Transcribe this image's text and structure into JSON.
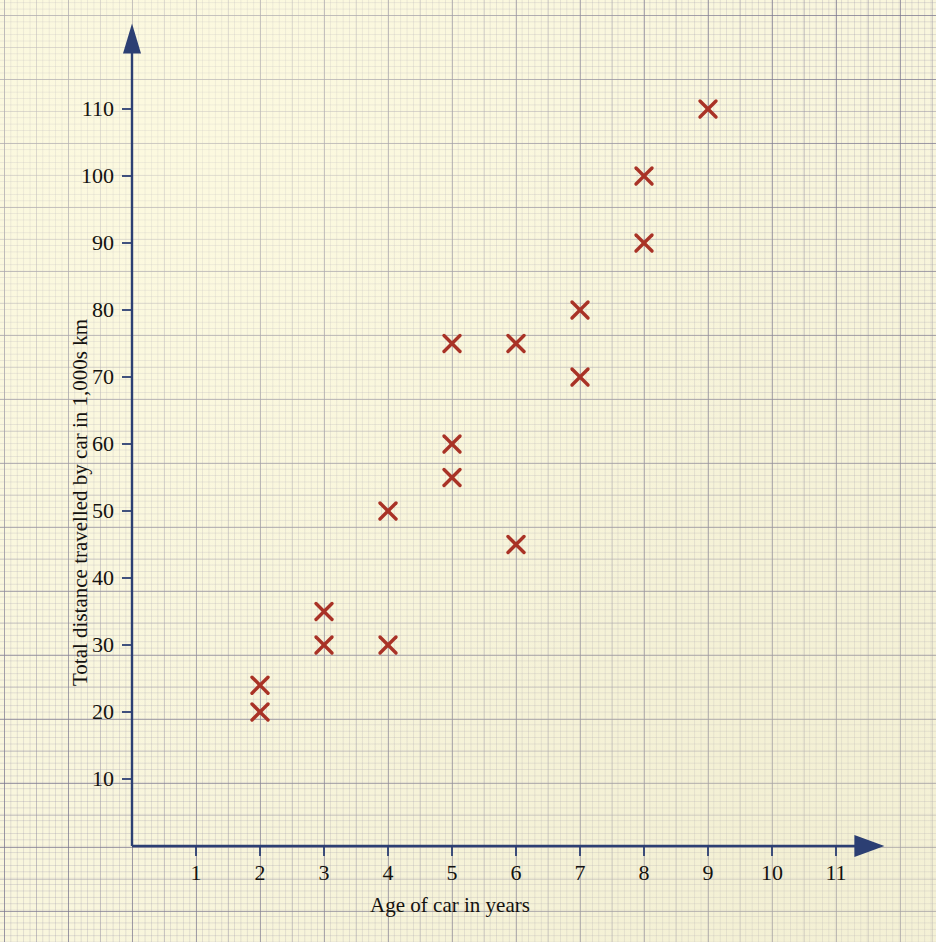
{
  "chart_data": {
    "type": "scatter",
    "title": "",
    "xlabel": "Age of car in years",
    "ylabel": "Total distance travelled by car in 1,000s km",
    "xlim": [
      0,
      11.6
    ],
    "ylim": [
      0,
      118
    ],
    "xticks": [
      1,
      2,
      3,
      4,
      5,
      6,
      7,
      8,
      9,
      10,
      11
    ],
    "yticks": [
      10,
      20,
      30,
      40,
      50,
      60,
      70,
      80,
      90,
      100,
      110
    ],
    "xtick_labels": [
      "1",
      "2",
      "3",
      "4",
      "5",
      "6",
      "7",
      "8",
      "9",
      "10",
      "11"
    ],
    "ytick_labels": [
      "10",
      "20",
      "30",
      "40",
      "50",
      "60",
      "70",
      "80",
      "90",
      "100",
      "110"
    ],
    "grid": true,
    "legend": null,
    "marker": "x",
    "marker_color": "#a93226",
    "axis_color": "#2c3f73",
    "background_color": "#f9f6dd",
    "points": [
      {
        "x": 2,
        "y": 20
      },
      {
        "x": 2,
        "y": 24
      },
      {
        "x": 3,
        "y": 30
      },
      {
        "x": 3,
        "y": 35
      },
      {
        "x": 4,
        "y": 30
      },
      {
        "x": 4,
        "y": 50
      },
      {
        "x": 5,
        "y": 55
      },
      {
        "x": 5,
        "y": 60
      },
      {
        "x": 5,
        "y": 75
      },
      {
        "x": 6,
        "y": 45
      },
      {
        "x": 6,
        "y": 75
      },
      {
        "x": 7,
        "y": 70
      },
      {
        "x": 7,
        "y": 80
      },
      {
        "x": 8,
        "y": 90
      },
      {
        "x": 8,
        "y": 100
      },
      {
        "x": 9,
        "y": 110
      }
    ],
    "x": [
      2,
      2,
      3,
      3,
      4,
      4,
      5,
      5,
      5,
      6,
      6,
      7,
      7,
      8,
      8,
      9
    ],
    "values": [
      20,
      24,
      30,
      35,
      30,
      50,
      55,
      60,
      75,
      45,
      75,
      70,
      80,
      90,
      100,
      110
    ]
  }
}
